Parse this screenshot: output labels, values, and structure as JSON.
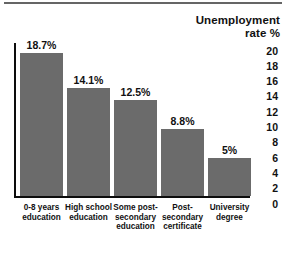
{
  "chart_data": {
    "type": "bar",
    "title": "Unemployment rate %",
    "title_lines": [
      "Unemployment",
      "rate %"
    ],
    "xlabel": "",
    "ylabel": "Unemployment rate %",
    "ylim": [
      0,
      20
    ],
    "ytick_step": 2,
    "grid": false,
    "legend": false,
    "orientation": "vertical",
    "axis_position": "right",
    "bar_color": "#6b6b6b",
    "axis_color": "#0d0d0d",
    "categories": [
      "0-8 years education",
      "High school education",
      "Some post-secondary education",
      "Post-secondary certificate",
      "University degree"
    ],
    "category_lines": [
      [
        "0-8 years",
        "education"
      ],
      [
        "High school",
        "education"
      ],
      [
        "Some post-",
        "secondary",
        "education"
      ],
      [
        "Post-",
        "secondary",
        "certificate"
      ],
      [
        "University",
        "degree"
      ]
    ],
    "values": [
      18.7,
      14.1,
      12.5,
      8.8,
      5
    ],
    "value_labels": [
      "18.7%",
      "14.1%",
      "12.5%",
      "8.8%",
      "5%"
    ],
    "yticks": [
      20,
      18,
      16,
      14,
      12,
      10,
      8,
      6,
      4,
      2,
      0
    ]
  }
}
